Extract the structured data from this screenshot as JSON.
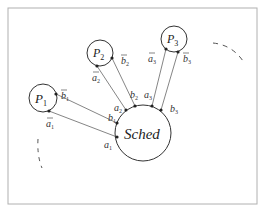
{
  "diagram": {
    "frame": {
      "x": 8,
      "y": 8,
      "w": 249,
      "h": 196,
      "stroke": "#b0b0b0"
    },
    "scheduler": {
      "label": "Sched",
      "cx": 143,
      "cy": 133,
      "r": 28
    },
    "processes": [
      {
        "label": "P",
        "sub": "1",
        "cx": 43,
        "cy": 98,
        "r": 14
      },
      {
        "label": "P",
        "sub": "2",
        "cx": 100,
        "cy": 53,
        "r": 13
      },
      {
        "label": "P",
        "sub": "3",
        "cx": 174,
        "cy": 39,
        "r": 13
      }
    ],
    "channels": [
      {
        "name": "a1",
        "from": [
          49,
          111
        ],
        "to": [
          117,
          137
        ],
        "bar_label": "a",
        "bar_sub": "1",
        "end_label": "a",
        "end_sub": "1"
      },
      {
        "name": "b1",
        "from": [
          56,
          94
        ],
        "to": [
          117,
          123
        ],
        "bar_label": "b",
        "bar_sub": "1",
        "end_label": "b",
        "end_sub": "1"
      },
      {
        "name": "a2",
        "from": [
          97,
          66
        ],
        "to": [
          126,
          110
        ],
        "bar_label": "a",
        "bar_sub": "2",
        "end_label": "a",
        "end_sub": "2"
      },
      {
        "name": "b2",
        "from": [
          112,
          58
        ],
        "to": [
          135,
          106
        ],
        "bar_label": "b",
        "bar_sub": "2",
        "end_label": "b",
        "end_sub": "2"
      },
      {
        "name": "a3",
        "from": [
          166,
          49
        ],
        "to": [
          152,
          106
        ],
        "bar_label": "a",
        "bar_sub": "3",
        "end_label": "a",
        "end_sub": "3"
      },
      {
        "name": "b3",
        "from": [
          178,
          52
        ],
        "to": [
          161,
          110
        ],
        "bar_label": "b",
        "bar_sub": "3",
        "end_label": "b",
        "end_sub": "3"
      }
    ],
    "colors": {
      "line": "#555555",
      "circle": "#333333",
      "dot": "#222222",
      "dash": "#555555"
    }
  }
}
